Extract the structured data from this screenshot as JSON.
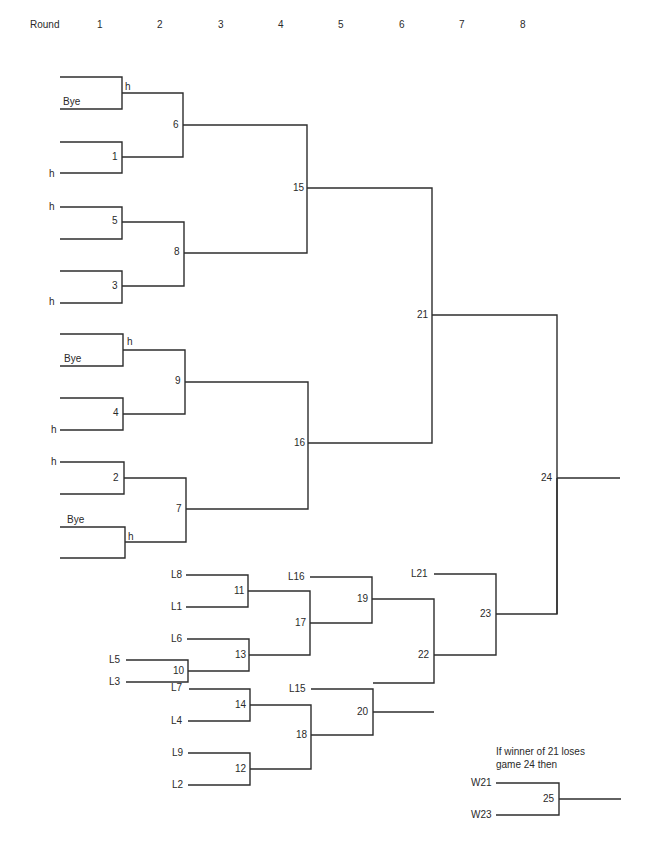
{
  "header": {
    "round_label": "Round",
    "rounds": [
      "1",
      "2",
      "3",
      "4",
      "5",
      "6",
      "7",
      "8"
    ]
  },
  "winners_bracket": {
    "entries": {
      "e1_top": "",
      "e1_bottom": "Bye",
      "e1_adv": "h",
      "e2_top": "",
      "e2_bottom": "h",
      "e3_top": "h",
      "e3_bottom": "",
      "e4_top": "",
      "e4_bottom": "h",
      "e5_top": "",
      "e5_bottom": "Bye",
      "e5_adv": "h",
      "e6_top": "",
      "e6_bottom": "h",
      "e7_top": "h",
      "e7_bottom": "",
      "e8_top": "Bye",
      "e8_bottom": "",
      "e8_adv": "h"
    },
    "games": {
      "g1": "1",
      "g2": "2",
      "g3": "3",
      "g4": "4",
      "g5": "5",
      "g6": "6",
      "g7": "7",
      "g8": "8",
      "g9": "9",
      "g15": "15",
      "g16": "16",
      "g21": "21",
      "g24": "24"
    }
  },
  "losers_bracket": {
    "entries": {
      "L8": "L8",
      "L1": "L1",
      "L6": "L6",
      "L5": "L5",
      "L3": "L3",
      "L7": "L7",
      "L4": "L4",
      "L9": "L9",
      "L2": "L2",
      "L16": "L16",
      "L15": "L15",
      "L21": "L21"
    },
    "games": {
      "g10": "10",
      "g11": "11",
      "g12": "12",
      "g13": "13",
      "g14": "14",
      "g17": "17",
      "g18": "18",
      "g19": "19",
      "g20": "20",
      "g22": "22",
      "g23": "23"
    }
  },
  "if_necessary": {
    "note_line1": "If winner of 21 loses",
    "note_line2": "game 24 then",
    "entry_top": "W21",
    "entry_bottom": "W23",
    "game": "25"
  }
}
